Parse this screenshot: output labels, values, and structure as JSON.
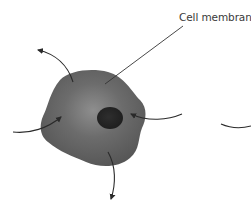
{
  "diagram": {
    "type": "biology-illustration",
    "subject": "cell",
    "labels": {
      "cell_membrane": "Cell membrane"
    },
    "parts": [
      {
        "name": "cell-body",
        "shape": "irregular-blob",
        "fill": "#5e5e5e",
        "highlight": "#8a8a8a"
      },
      {
        "name": "nucleus",
        "shape": "ellipse",
        "fill": "#262626"
      },
      {
        "name": "membrane-leader-line",
        "color": "#333333"
      }
    ],
    "arrows": [
      {
        "name": "arrow-out-top-left",
        "direction": "outward"
      },
      {
        "name": "arrow-in-left",
        "direction": "inward"
      },
      {
        "name": "arrow-in-right",
        "direction": "inward"
      },
      {
        "name": "arrow-out-bottom",
        "direction": "outward"
      },
      {
        "name": "partial-arc-right-edge",
        "direction": "cut-off"
      }
    ],
    "colors": {
      "background": "#ffffff",
      "cell_fill": "#5e5e5e",
      "cell_highlight": "#8c8c8c",
      "nucleus": "#262626",
      "arrow": "#2a2a2a",
      "label_text": "#3a3a3a"
    }
  }
}
